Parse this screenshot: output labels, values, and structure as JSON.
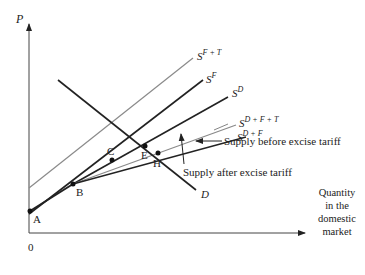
{
  "axes": {
    "y_label": "P",
    "origin_label": "0",
    "x_label_lines": [
      "Quantity",
      "in the",
      "domestic",
      "market"
    ]
  },
  "curves": {
    "sft": {
      "base": "S",
      "sup": "F + T"
    },
    "sf": {
      "base": "S",
      "sup": "F"
    },
    "sd": {
      "base": "S",
      "sup": "D"
    },
    "sdft": {
      "base": "S",
      "sup": "D + F + T"
    },
    "sdf": {
      "base": "S",
      "sup": "D + F"
    },
    "demand": "D"
  },
  "points": [
    "A",
    "B",
    "C",
    "E",
    "H"
  ],
  "annotations": {
    "before": "Supply before excise tariff",
    "after": "Supply after excise tariff"
  },
  "colors": {
    "black": "#222222",
    "gray": "#8a8a8a"
  }
}
